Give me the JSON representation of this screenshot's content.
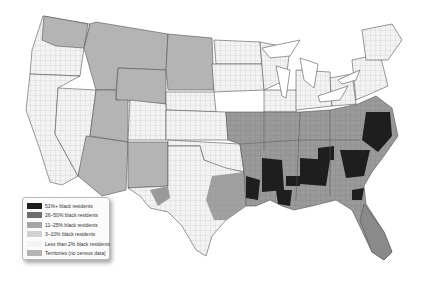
{
  "map": {
    "title": "",
    "subject": "Share of black residents by U.S. county",
    "colors": {
      "c51plus": "#1e1e1e",
      "c26to50": "#6e6e6e",
      "c11to25": "#a6a6a6",
      "c3to10": "#d2d2d2",
      "lt2": "#f2f2f2",
      "territories": "#b4b4b4",
      "border": "#555555"
    }
  },
  "legend": {
    "items": [
      {
        "label": "51%+ black residents",
        "color": "#1e1e1e"
      },
      {
        "label": "26–50% black residents",
        "color": "#6e6e6e"
      },
      {
        "label": "11–25% black residents",
        "color": "#a6a6a6"
      },
      {
        "label": "3–10% black residents",
        "color": "#d2d2d2"
      },
      {
        "label": "Less than 2% black residents",
        "color": "#f4f4f4"
      },
      {
        "label": "Territories (no census data)",
        "color": "#b4b4b4"
      }
    ]
  }
}
